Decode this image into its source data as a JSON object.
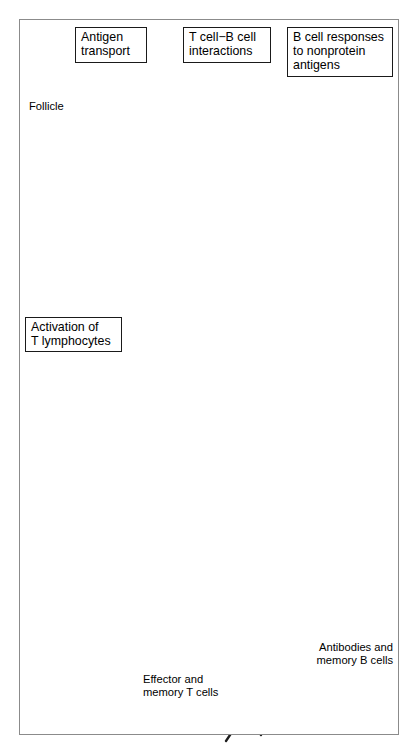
{
  "figure": {
    "title_alt": "Sequence of events in immune response within a lymph node",
    "frame_color": "#8b8b8b",
    "background": "#ffffff"
  },
  "palette": {
    "node_body": "#c9c9c9",
    "node_rim": "#a8a8a8",
    "follicle": "#bdbdbd",
    "follicle_halo": "#ffffff",
    "cell_fill": "#b6b6b6",
    "cell_dark": "#2b2b2b",
    "arrow_gray": "#9a9a9a",
    "vessel": "#dedede",
    "outline": "#5a5a5a",
    "text": "#000000"
  },
  "callouts": [
    {
      "id": "antigen-transport",
      "lines": [
        "Antigen",
        "transport"
      ],
      "x": 75,
      "y": 27,
      "w": 72,
      "h": 36
    },
    {
      "id": "t-b-interactions",
      "lines": [
        "T cell−B cell",
        "interactions"
      ],
      "x": 183,
      "y": 27,
      "w": 88,
      "h": 36
    },
    {
      "id": "b-cell-nonprotein",
      "lines": [
        "B cell responses",
        "to nonprotein",
        "antigens"
      ],
      "x": 287,
      "y": 27,
      "w": 106,
      "h": 50
    },
    {
      "id": "activation-t-lymphocytes",
      "lines": [
        "Activation of",
        "T lymphocytes"
      ],
      "x": 25,
      "y": 317,
      "w": 97,
      "h": 35
    }
  ],
  "plain_labels": [
    {
      "id": "follicle",
      "text": "Follicle",
      "x": 29,
      "y": 107,
      "align": "left"
    },
    {
      "id": "effector-memory-t",
      "text_lines": [
        "Effector and",
        "memory T cells"
      ],
      "x": 143,
      "y": 673,
      "align": "left"
    },
    {
      "id": "antibodies-memory-b",
      "text_lines": [
        "Antibodies and",
        "memory B cells"
      ],
      "x": 307,
      "y": 641,
      "align": "right"
    }
  ],
  "structures": {
    "upper_node_label": "upper lymph node",
    "lower_node_label": "lower lymph node",
    "follicles_upper": 2,
    "follicles_lower": 2,
    "afferent_vessels": 2,
    "efferent_vessels": 2,
    "plasma_cells": 2,
    "dendritic_cell_outside": 1
  }
}
